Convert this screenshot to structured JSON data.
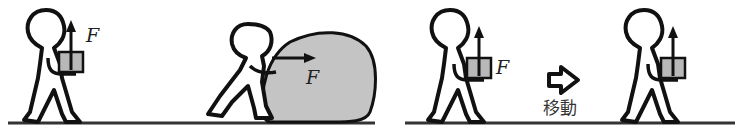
{
  "figure": {
    "scenes": [
      {
        "id": "lift-box",
        "description": "Person holding a box with upward force F",
        "force_label": "F",
        "force_direction": "up"
      },
      {
        "id": "push-boulder",
        "description": "Person pushing a large boulder with horizontal force F",
        "force_label": "F",
        "force_direction": "right"
      },
      {
        "id": "carry-box-before",
        "description": "Person holding a box with upward force F before moving",
        "force_label": "F",
        "force_direction": "up"
      },
      {
        "id": "carry-box-after",
        "description": "Same person after moving horizontally, still holding box with upward force",
        "force_label": "",
        "force_direction": "up"
      }
    ],
    "transition": {
      "icon": "right-arrow-icon",
      "label": "移動"
    },
    "colors": {
      "stroke": "#111111",
      "box_fill": "#b8b8b8",
      "boulder_fill": "#c4c4c4",
      "ground": "#333333"
    }
  }
}
